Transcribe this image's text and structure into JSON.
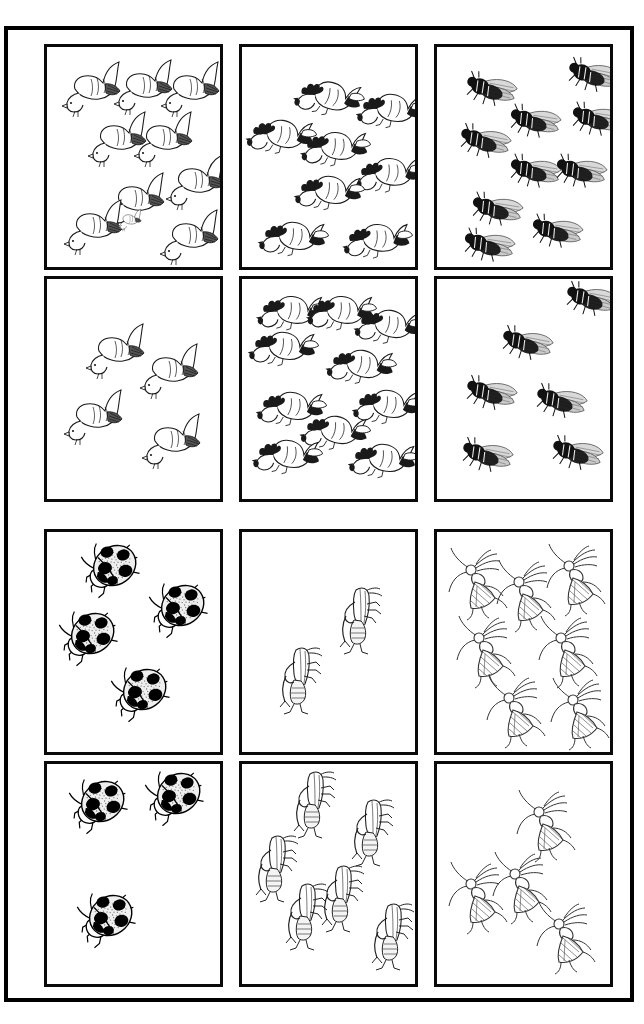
{
  "worksheet": {
    "title": "Counting Worksheet",
    "description": "Six bordered panels, each divided into an upper and a lower box containing line-art animals and insects to count.",
    "background_color": "#ffffff",
    "ink_color": "#000000",
    "outer_frame": {
      "stroke_color": "#000000",
      "stroke_width": 4
    },
    "cell_border": {
      "stroke_color": "#0a0a0a",
      "stroke_width": 3
    }
  },
  "panels": [
    {
      "panel_id": "panel-row1-col1",
      "icon_name": "dove-icon",
      "subject": "dove",
      "position": {
        "left": 36,
        "top": 14
      },
      "cells": [
        {
          "cell_id": "cell-r1c1-top",
          "count": 10,
          "items": [
            {
              "x": 14,
              "y": 12,
              "r": 0,
              "s": 1.0
            },
            {
              "x": 66,
              "y": 10,
              "r": 0,
              "s": 1.0
            },
            {
              "x": 113,
              "y": 12,
              "r": 0,
              "s": 1.0
            },
            {
              "x": 40,
              "y": 62,
              "r": 0,
              "s": 1.0
            },
            {
              "x": 86,
              "y": 62,
              "r": 0,
              "s": 1.0
            },
            {
              "x": 118,
              "y": 105,
              "r": 0,
              "s": 1.0
            },
            {
              "x": 58,
              "y": 123,
              "r": 0,
              "s": 1.0
            },
            {
              "x": 16,
              "y": 150,
              "r": 0,
              "s": 1.0
            },
            {
              "x": 112,
              "y": 160,
              "r": 0,
              "s": 1.0
            },
            {
              "x": 52,
              "y": 143,
              "r": 0,
              "s": 0.4
            }
          ]
        },
        {
          "cell_id": "cell-r1c1-bottom",
          "count": 4,
          "items": [
            {
              "x": 38,
              "y": 42,
              "r": 0,
              "s": 1.0
            },
            {
              "x": 92,
              "y": 62,
              "r": 0,
              "s": 1.0
            },
            {
              "x": 16,
              "y": 108,
              "r": 0,
              "s": 1.0
            },
            {
              "x": 94,
              "y": 132,
              "r": 0,
              "s": 1.0
            }
          ]
        }
      ]
    },
    {
      "panel_id": "panel-row1-col2",
      "icon_name": "rooster-icon",
      "subject": "rooster",
      "position": {
        "left": 231,
        "top": 14
      },
      "cells": [
        {
          "cell_id": "cell-r1c2-top",
          "count": 9,
          "items": [
            {
              "x": 56,
              "y": 20,
              "r": 18,
              "s": 1.0
            },
            {
              "x": 118,
              "y": 32,
              "r": 12,
              "s": 1.0
            },
            {
              "x": 8,
              "y": 58,
              "r": 14,
              "s": 1.0
            },
            {
              "x": 62,
              "y": 70,
              "r": 10,
              "s": 1.0
            },
            {
              "x": 116,
              "y": 96,
              "r": 8,
              "s": 1.0
            },
            {
              "x": 56,
              "y": 114,
              "r": 12,
              "s": 1.0
            },
            {
              "x": 20,
              "y": 160,
              "r": 12,
              "s": 1.0
            },
            {
              "x": 104,
              "y": 162,
              "r": 8,
              "s": 1.0
            },
            {
              "x": 130,
              "y": 24,
              "r": 8,
              "s": 0.0
            }
          ]
        },
        {
          "cell_id": "cell-r1c2-bottom",
          "count": 10,
          "items": [
            {
              "x": 18,
              "y": 2,
              "r": 10,
              "s": 1.0
            },
            {
              "x": 68,
              "y": 2,
              "r": 10,
              "s": 1.0
            },
            {
              "x": 116,
              "y": 16,
              "r": 14,
              "s": 1.0
            },
            {
              "x": 10,
              "y": 38,
              "r": 12,
              "s": 1.0
            },
            {
              "x": 88,
              "y": 56,
              "r": 14,
              "s": 1.0
            },
            {
              "x": 18,
              "y": 98,
              "r": 12,
              "s": 1.0
            },
            {
              "x": 114,
              "y": 96,
              "r": 12,
              "s": 1.0
            },
            {
              "x": 62,
              "y": 122,
              "r": 14,
              "s": 1.0
            },
            {
              "x": 14,
              "y": 146,
              "r": 12,
              "s": 1.0
            },
            {
              "x": 110,
              "y": 150,
              "r": 12,
              "s": 1.0
            }
          ]
        }
      ]
    },
    {
      "panel_id": "panel-row1-col3",
      "icon_name": "housefly-icon",
      "subject": "fly",
      "position": {
        "left": 426,
        "top": 14
      },
      "cells": [
        {
          "cell_id": "cell-r1c3-top",
          "count": 9,
          "items": [
            {
              "x": 26,
              "y": 26,
              "r": 18,
              "s": 1.0
            },
            {
              "x": 128,
              "y": 12,
              "r": 18,
              "s": 1.0
            },
            {
              "x": 70,
              "y": 58,
              "r": 16,
              "s": 1.0
            },
            {
              "x": 132,
              "y": 56,
              "r": 16,
              "s": 1.0
            },
            {
              "x": 20,
              "y": 78,
              "r": 18,
              "s": 1.0
            },
            {
              "x": 70,
              "y": 108,
              "r": 16,
              "s": 1.0
            },
            {
              "x": 116,
              "y": 108,
              "r": 16,
              "s": 1.0
            },
            {
              "x": 32,
              "y": 146,
              "r": 16,
              "s": 1.0
            },
            {
              "x": 92,
              "y": 168,
              "r": 16,
              "s": 1.0
            },
            {
              "x": 24,
              "y": 182,
              "r": 16,
              "s": 1.0
            }
          ]
        },
        {
          "cell_id": "cell-r1c3-bottom",
          "count": 6,
          "items": [
            {
              "x": 126,
              "y": 4,
              "r": 18,
              "s": 1.0
            },
            {
              "x": 62,
              "y": 48,
              "r": 18,
              "s": 1.0
            },
            {
              "x": 26,
              "y": 98,
              "r": 18,
              "s": 1.0
            },
            {
              "x": 96,
              "y": 106,
              "r": 18,
              "s": 1.0
            },
            {
              "x": 22,
              "y": 160,
              "r": 18,
              "s": 1.0
            },
            {
              "x": 112,
              "y": 158,
              "r": 18,
              "s": 1.0
            }
          ]
        }
      ]
    },
    {
      "panel_id": "panel-row2-col1",
      "icon_name": "ladybug-icon",
      "subject": "ladybug",
      "position": {
        "left": 36,
        "top": 499
      },
      "cells": [
        {
          "cell_id": "cell-r2c1-top",
          "count": 4,
          "items": [
            {
              "x": 36,
              "y": 6,
              "r": -15,
              "s": 1.0
            },
            {
              "x": 104,
              "y": 46,
              "r": -15,
              "s": 1.0
            },
            {
              "x": 14,
              "y": 74,
              "r": -15,
              "s": 1.0
            },
            {
              "x": 66,
              "y": 130,
              "r": -15,
              "s": 1.0
            }
          ]
        },
        {
          "cell_id": "cell-r2c1-bottom",
          "count": 3,
          "items": [
            {
              "x": 24,
              "y": 10,
              "r": -15,
              "s": 1.0
            },
            {
              "x": 100,
              "y": 2,
              "r": -15,
              "s": 1.0
            },
            {
              "x": 32,
              "y": 124,
              "r": -15,
              "s": 1.0
            }
          ]
        }
      ]
    },
    {
      "panel_id": "panel-row2-col2",
      "icon_name": "grasshopper-icon",
      "subject": "grasshopper",
      "position": {
        "left": 231,
        "top": 499
      },
      "cells": [
        {
          "cell_id": "cell-r2c2-top",
          "count": 2,
          "items": [
            {
              "x": 96,
              "y": 52,
              "r": 0,
              "s": 1.0
            },
            {
              "x": 36,
              "y": 112,
              "r": 0,
              "s": 1.0
            }
          ]
        },
        {
          "cell_id": "cell-r2c2-bottom",
          "count": 6,
          "items": [
            {
              "x": 50,
              "y": 4,
              "r": 0,
              "s": 1.0
            },
            {
              "x": 108,
              "y": 32,
              "r": 0,
              "s": 1.0
            },
            {
              "x": 12,
              "y": 68,
              "r": 0,
              "s": 1.0
            },
            {
              "x": 78,
              "y": 98,
              "r": 0,
              "s": 1.0
            },
            {
              "x": 42,
              "y": 116,
              "r": 0,
              "s": 1.0
            },
            {
              "x": 128,
              "y": 136,
              "r": 0,
              "s": 1.0
            }
          ]
        }
      ]
    },
    {
      "panel_id": "panel-row2-col3",
      "icon_name": "mosquito-icon",
      "subject": "mosquito",
      "position": {
        "left": 426,
        "top": 499
      },
      "cells": [
        {
          "cell_id": "cell-r2c3-top",
          "count": 7,
          "items": [
            {
              "x": 14,
              "y": 18,
              "r": 0,
              "s": 1.0
            },
            {
              "x": 62,
              "y": 30,
              "r": 0,
              "s": 1.0
            },
            {
              "x": 112,
              "y": 14,
              "r": 0,
              "s": 1.0
            },
            {
              "x": 22,
              "y": 86,
              "r": 0,
              "s": 1.0
            },
            {
              "x": 104,
              "y": 86,
              "r": 0,
              "s": 1.0
            },
            {
              "x": 52,
              "y": 146,
              "r": 0,
              "s": 1.0
            },
            {
              "x": 116,
              "y": 148,
              "r": 0,
              "s": 1.0
            }
          ]
        },
        {
          "cell_id": "cell-r2c3-bottom",
          "count": 4,
          "items": [
            {
              "x": 82,
              "y": 28,
              "r": 0,
              "s": 1.0
            },
            {
              "x": 14,
              "y": 100,
              "r": 0,
              "s": 1.0
            },
            {
              "x": 58,
              "y": 90,
              "r": 0,
              "s": 1.0
            },
            {
              "x": 102,
              "y": 140,
              "r": 0,
              "s": 1.0
            }
          ]
        }
      ]
    }
  ]
}
